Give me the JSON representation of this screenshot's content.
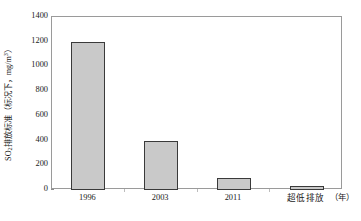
{
  "chart_data": {
    "type": "bar",
    "title": "",
    "subtitle": "",
    "xlabel": "（年）",
    "ylabel": "SO₂排放标准（标况下，mg/m³）",
    "ylabel_parts": {
      "prefix": "SO",
      "subscript": "2",
      "middle": "排放标准（标况下，mg/m",
      "superscript": "3",
      "suffix": "）"
    },
    "categories": [
      "1996",
      "2003",
      "2011",
      "超低排放"
    ],
    "values": [
      1200,
      400,
      100,
      35
    ],
    "series": [
      {
        "name": "SO₂排放标准",
        "values": [
          1200,
          400,
          100,
          35
        ]
      }
    ],
    "ylim": [
      0,
      1400
    ],
    "yticks": [
      0,
      200,
      400,
      600,
      800,
      1000,
      1200,
      1400
    ],
    "ytick_labels": [
      "0",
      "200",
      "400",
      "600",
      "800",
      "1000",
      "1200",
      "1400"
    ],
    "xtick_labels": [
      "1996",
      "2003",
      "2011",
      "超低排放"
    ],
    "x_unit_label": "（年）",
    "grid": false,
    "legend": false,
    "legend_position": "none",
    "bar_fill_color": "#c9c9c9",
    "bar_edge_color": "#3a3a3a",
    "axis_color": "#9a9a9a",
    "text_color": "#1a1a1a",
    "background_color": "#ffffff",
    "annotations": []
  },
  "accessibility": {
    "chart_role": "bar-chart",
    "description": "SO2 emission standard bar chart"
  }
}
